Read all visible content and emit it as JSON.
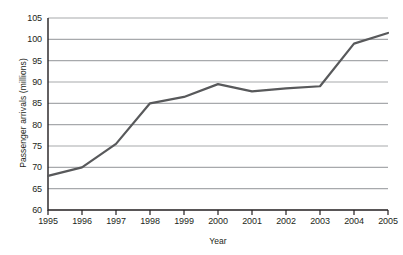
{
  "chart_data": {
    "type": "line",
    "title": "",
    "xlabel": "Year",
    "ylabel": "Passenger arrivals (millions)",
    "categories": [
      "1995",
      "1996",
      "1997",
      "1998",
      "1999",
      "2000",
      "2001",
      "2002",
      "2003",
      "2004",
      "2005"
    ],
    "x": [
      1995,
      1996,
      1997,
      1998,
      1999,
      2000,
      2001,
      2002,
      2003,
      2004,
      2005
    ],
    "values": [
      68,
      70,
      75.5,
      85,
      86.5,
      89.5,
      87.8,
      88.5,
      89,
      99,
      101.5
    ],
    "series": [
      {
        "name": "Passenger arrivals",
        "values": [
          68,
          70,
          75.5,
          85,
          86.5,
          89.5,
          87.8,
          88.5,
          89,
          99,
          101.5
        ]
      }
    ],
    "ylim": [
      60,
      105
    ],
    "ytick_labels": [
      "60",
      "65",
      "70",
      "75",
      "80",
      "85",
      "90",
      "95",
      "100",
      "105"
    ],
    "yticks": [
      60,
      65,
      70,
      75,
      80,
      85,
      90,
      95,
      100,
      105
    ],
    "xlim": [
      1995,
      2005
    ],
    "grid": "horizontal",
    "legend": "none",
    "line_color": "#58595b",
    "grid_color": "#a7a9ac",
    "axis_color": "#231f20",
    "background_color": "#ffffff"
  },
  "figure": {
    "title_remnant": ""
  }
}
